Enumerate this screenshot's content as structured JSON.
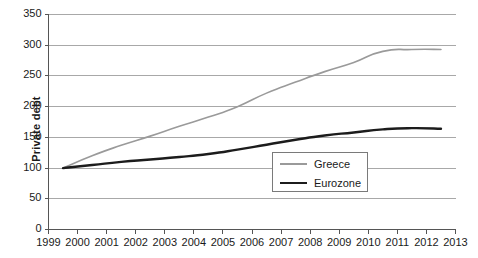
{
  "chart_data": {
    "type": "line",
    "title": "",
    "subtitle": "",
    "xlabel": "",
    "ylabel": "Private debt",
    "xlim": [
      1999,
      2013
    ],
    "ylim": [
      0,
      350
    ],
    "grid": true,
    "legend_position": "inside-center-right",
    "x_ticks": [
      "1999",
      "2000",
      "2001",
      "2002",
      "2003",
      "2004",
      "2005",
      "2006",
      "2007",
      "2008",
      "2009",
      "2010",
      "2011",
      "2012",
      "2013"
    ],
    "y_ticks": [
      "0",
      "50",
      "100",
      "150",
      "200",
      "250",
      "300",
      "350"
    ],
    "x": [
      1999.5,
      2000.5,
      2001.5,
      2002.5,
      2003.5,
      2004.5,
      2005.5,
      2006.5,
      2007.5,
      2008.5,
      2009.5,
      2010.5,
      2011.5,
      2012.5
    ],
    "series": [
      {
        "name": "Greece",
        "color": "#9a9a9a",
        "width": 1.6,
        "values": [
          100,
          120,
          137,
          152,
          168,
          183,
          200,
          222,
          240,
          257,
          272,
          290,
          293,
          293
        ]
      },
      {
        "name": "Eurozone",
        "color": "#1c1c1c",
        "width": 2.4,
        "values": [
          100,
          105,
          110,
          114,
          118,
          123,
          130,
          138,
          146,
          153,
          158,
          163,
          165,
          164
        ]
      }
    ]
  },
  "legend": {
    "entries": [
      {
        "label": "Greece"
      },
      {
        "label": "Eurozone"
      }
    ]
  },
  "colors": {
    "greece": "#9a9a9a",
    "eurozone": "#1c1c1c",
    "grid": "#a8a8a8",
    "axis": "#555555",
    "text": "#1a1a1a",
    "background": "#ffffff"
  }
}
